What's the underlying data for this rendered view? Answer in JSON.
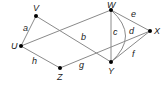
{
  "graph": {
    "nodes": [
      {
        "id": "V",
        "label": "V",
        "x": 36,
        "y": 16
      },
      {
        "id": "U",
        "label": "U",
        "x": 21,
        "y": 46
      },
      {
        "id": "Z",
        "label": "Z",
        "x": 60,
        "y": 68
      },
      {
        "id": "W",
        "label": "W",
        "x": 111,
        "y": 10
      },
      {
        "id": "Y",
        "label": "Y",
        "x": 111,
        "y": 62
      },
      {
        "id": "X",
        "label": "X",
        "x": 150,
        "y": 31
      }
    ],
    "edges": [
      {
        "id": "a",
        "label": "a",
        "from": "U",
        "to": "V"
      },
      {
        "id": "b",
        "label": "b",
        "from": "V",
        "to": "Y"
      },
      {
        "id": "uw",
        "label": "",
        "from": "U",
        "to": "W"
      },
      {
        "id": "h",
        "label": "h",
        "from": "U",
        "to": "Z"
      },
      {
        "id": "g",
        "label": "g",
        "from": "Z",
        "to": "X"
      },
      {
        "id": "c",
        "label": "c",
        "from": "W",
        "to": "Y"
      },
      {
        "id": "d",
        "label": "d",
        "from": "W",
        "to": "Y",
        "curved": true
      },
      {
        "id": "e",
        "label": "e",
        "from": "W",
        "to": "X"
      },
      {
        "id": "f",
        "label": "f",
        "from": "Y",
        "to": "X"
      }
    ],
    "colors": {
      "edge": "#8a8a8a",
      "node": "#000000",
      "text": "#222222"
    }
  }
}
